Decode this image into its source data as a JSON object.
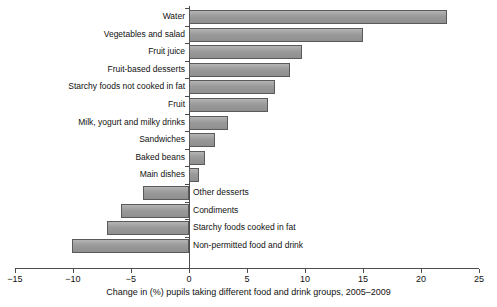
{
  "chart_data": {
    "type": "bar",
    "orientation": "horizontal",
    "title": "",
    "xlabel": "Change in (%) pupils taking different food and drink groups, 2005–2009",
    "ylabel": "",
    "xlim": [
      -15,
      25
    ],
    "xticks": [
      -15,
      -10,
      -5,
      0,
      5,
      10,
      15,
      20,
      25
    ],
    "xticklabels": [
      "−15",
      "−10",
      "−5",
      "0",
      "5",
      "10",
      "15",
      "20",
      "25"
    ],
    "grid": false,
    "legend": false,
    "bar_color": "#a0a0a0",
    "bar_edge_color": "#5a5a5a",
    "axis_color": "#4d4d4d",
    "categories": [
      "Water",
      "Vegetables and salad",
      "Fruit juice",
      "Fruit-based desserts",
      "Starchy foods not cooked in fat",
      "Fruit",
      "Milk, yogurt and milky drinks",
      "Sandwiches",
      "Baked beans",
      "Main dishes",
      "Other desserts",
      "Condiments",
      "Starchy foods cooked in fat",
      "Non-permitted food and drink"
    ],
    "values": [
      22.2,
      15.0,
      9.7,
      8.7,
      7.4,
      6.8,
      3.4,
      2.2,
      1.4,
      0.9,
      -4.0,
      -5.9,
      -7.1,
      -10.1
    ]
  }
}
